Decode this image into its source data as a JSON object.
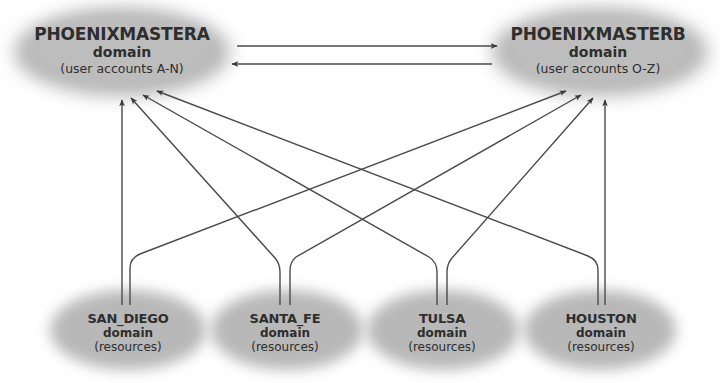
{
  "diagram": {
    "type": "domain-trust-relationships",
    "colors": {
      "cloud": "#b4b4b4",
      "line": "#4a4a4a",
      "text": "#2e2e2e",
      "background": "#ffffff"
    },
    "master_domains": [
      {
        "id": "phoenixmastera",
        "name": "PHOENIXMASTERA",
        "type_label": "domain",
        "description": "(user accounts A-N)"
      },
      {
        "id": "phoenixmasterb",
        "name": "PHOENIXMASTERB",
        "type_label": "domain",
        "description": "(user accounts O-Z)"
      }
    ],
    "resource_domains": [
      {
        "id": "san_diego",
        "name": "SAN_DIEGO",
        "type_label": "domain",
        "description": "(resources)"
      },
      {
        "id": "santa_fe",
        "name": "SANTA_FE",
        "type_label": "domain",
        "description": "(resources)"
      },
      {
        "id": "tulsa",
        "name": "TULSA",
        "type_label": "domain",
        "description": "(resources)"
      },
      {
        "id": "houston",
        "name": "HOUSTON",
        "type_label": "domain",
        "description": "(resources)"
      }
    ],
    "edges": [
      {
        "from": "PHOENIXMASTERA",
        "to": "PHOENIXMASTERB"
      },
      {
        "from": "PHOENIXMASTERB",
        "to": "PHOENIXMASTERA"
      },
      {
        "from": "SAN_DIEGO",
        "to": "PHOENIXMASTERA"
      },
      {
        "from": "SAN_DIEGO",
        "to": "PHOENIXMASTERB"
      },
      {
        "from": "SANTA_FE",
        "to": "PHOENIXMASTERA"
      },
      {
        "from": "SANTA_FE",
        "to": "PHOENIXMASTERB"
      },
      {
        "from": "TULSA",
        "to": "PHOENIXMASTERA"
      },
      {
        "from": "TULSA",
        "to": "PHOENIXMASTERB"
      },
      {
        "from": "HOUSTON",
        "to": "PHOENIXMASTERA"
      },
      {
        "from": "HOUSTON",
        "to": "PHOENIXMASTERB"
      }
    ]
  }
}
